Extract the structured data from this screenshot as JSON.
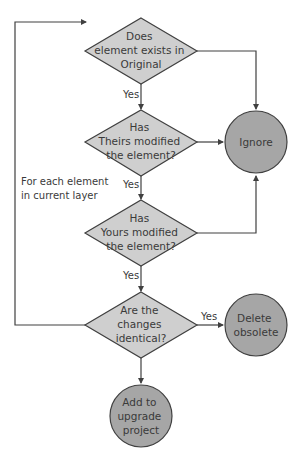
{
  "colors": {
    "shape_fill_diamond": "#cfcfcf",
    "shape_fill_circle": "#a6a6a6",
    "stroke": "#404040",
    "text": "#3a3a3a"
  },
  "diagram": {
    "type": "flowchart",
    "loop_label": [
      "For each element",
      "in current layer"
    ],
    "decisions": [
      {
        "id": "d1",
        "lines": [
          "Does",
          "element exists in",
          "Original"
        ]
      },
      {
        "id": "d2",
        "lines": [
          "Has",
          "Theirs modified",
          "the element?"
        ]
      },
      {
        "id": "d3",
        "lines": [
          "Has",
          "Yours modified",
          "the element?"
        ]
      },
      {
        "id": "d4",
        "lines": [
          "Are the",
          "changes",
          "identical?"
        ]
      }
    ],
    "terminals": [
      {
        "id": "ignore",
        "lines": [
          "Ignore"
        ]
      },
      {
        "id": "delete",
        "lines": [
          "Delete",
          "obsolete"
        ]
      },
      {
        "id": "add",
        "lines": [
          "Add to",
          "upgrade",
          "project"
        ]
      }
    ],
    "edge_labels": {
      "d1_to_d2": "Yes",
      "d2_to_d3": "Yes",
      "d3_to_d4": "Yes",
      "d4_to_delete": "Yes"
    }
  }
}
